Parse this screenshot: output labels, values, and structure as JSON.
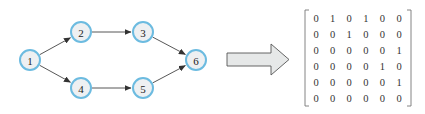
{
  "graph": {
    "nodes": [
      {
        "id": "1",
        "label": "1",
        "x": 30,
        "y": 60
      },
      {
        "id": "2",
        "label": "2",
        "x": 81,
        "y": 32
      },
      {
        "id": "3",
        "label": "3",
        "x": 143,
        "y": 32
      },
      {
        "id": "4",
        "label": "4",
        "x": 81,
        "y": 88
      },
      {
        "id": "5",
        "label": "5",
        "x": 143,
        "y": 88
      },
      {
        "id": "6",
        "label": "6",
        "x": 196,
        "y": 60
      }
    ],
    "edges": [
      {
        "from": "1",
        "to": "2"
      },
      {
        "from": "1",
        "to": "4"
      },
      {
        "from": "2",
        "to": "3"
      },
      {
        "from": "3",
        "to": "6"
      },
      {
        "from": "4",
        "to": "5"
      },
      {
        "from": "5",
        "to": "6"
      }
    ],
    "node_radius": 10,
    "colors": {
      "node_fill": "#eef0f2",
      "node_stroke": "#6cbbe0",
      "edge": "#444444"
    }
  },
  "arrow": {
    "fill": "#e6e8e8",
    "stroke": "#555555"
  },
  "matrix": {
    "rows": [
      [
        "0",
        "1",
        "0",
        "1",
        "0",
        "0"
      ],
      [
        "0",
        "0",
        "1",
        "0",
        "0",
        "0"
      ],
      [
        "0",
        "0",
        "0",
        "0",
        "0",
        "1"
      ],
      [
        "0",
        "0",
        "0",
        "0",
        "1",
        "0"
      ],
      [
        "0",
        "0",
        "0",
        "0",
        "0",
        "1"
      ],
      [
        "0",
        "0",
        "0",
        "0",
        "0",
        "0"
      ]
    ]
  }
}
